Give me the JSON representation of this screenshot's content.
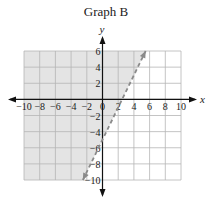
{
  "chart_data": {
    "type": "line",
    "title": "Graph B",
    "xlabel": "x",
    "ylabel": "y",
    "xlim": [
      -10,
      10
    ],
    "ylim": [
      -10,
      6
    ],
    "x_ticks": [
      -10,
      -8,
      -6,
      -4,
      -2,
      0,
      2,
      4,
      6,
      8,
      10
    ],
    "y_ticks": [
      6,
      4,
      2,
      -2,
      -4,
      -6,
      -8,
      -10
    ],
    "grid": true,
    "grid_step": 2,
    "boundary_line": {
      "equation": "y = 2x - 5",
      "style": "dashed",
      "slope": 2,
      "intercept": -5,
      "points": [
        [
          -2.5,
          -10
        ],
        [
          5.5,
          6
        ]
      ],
      "arrows": "both ends"
    },
    "shaded_region": "left/above the line (y > 2x - 5)",
    "colors": {
      "shade": "#e4e4e4",
      "grid": "#b5b5b5",
      "line": "#8a8a8a",
      "axis": "#111111"
    }
  }
}
